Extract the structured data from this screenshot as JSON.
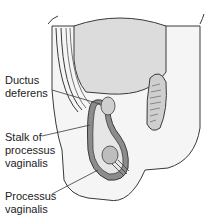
{
  "figure": {
    "type": "anatomical-diagram",
    "subject": "processus vaginalis",
    "colors": {
      "background": "#ffffff",
      "fill_light": "#ececec",
      "fill_mid": "#d4d4d4",
      "fill_dark": "#8c8c8c",
      "outline": "#3a3a3a"
    }
  },
  "labels": {
    "ductus_deferens": {
      "line1": "Ductus",
      "line2": "deferens"
    },
    "stalk": {
      "line1": "Stalk of",
      "line2": "processus",
      "line3": "vaginalis"
    },
    "processus": {
      "line1": "Processus",
      "line2": "vaginalis"
    }
  }
}
